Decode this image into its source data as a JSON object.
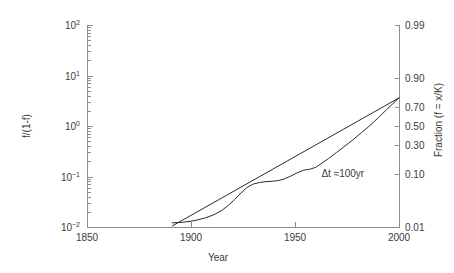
{
  "chart_data": {
    "type": "line",
    "title": "",
    "xlabel": "Year",
    "ylabel_left": "f/(1-f)",
    "ylabel_right": "Fraction (f = x/K)",
    "xlim": [
      1850,
      2000
    ],
    "ylim_odds": [
      0.01,
      100
    ],
    "yscale": "log-odds (logit)",
    "grid": false,
    "legend": "none",
    "xticks": [
      1850,
      1900,
      1950,
      2000
    ],
    "xticklabels": [
      "1850",
      "1900",
      "1950",
      "2000"
    ],
    "yticks_left_odds": [
      0.01,
      0.1,
      1,
      10,
      100
    ],
    "yticklabels_left": [
      "10-2",
      "10-1",
      "100",
      "101",
      "102"
    ],
    "yticks_right_fraction": [
      0.01,
      0.1,
      0.3,
      0.5,
      0.7,
      0.9,
      0.99
    ],
    "yticklabels_right": [
      "0.01",
      "0.10",
      "0.30",
      "0.50",
      "0.70",
      "0.90",
      "0.99"
    ],
    "annotations": [
      {
        "text": "Δt ≈100yr",
        "x": 1973,
        "y_fraction": 0.105
      }
    ],
    "series": [
      {
        "name": "logistic-fit-line",
        "style": "straight",
        "x": [
          1891,
          2000
        ],
        "y_odds": [
          0.0105,
          3.6
        ]
      },
      {
        "name": "observed-fraction",
        "style": "wiggly",
        "x": [
          1891,
          1896,
          1900,
          1903,
          1907,
          1911,
          1915,
          1918,
          1921,
          1924,
          1927,
          1930,
          1933,
          1936,
          1939,
          1942,
          1945,
          1948,
          1951,
          1954,
          1957,
          1960,
          1963,
          1966,
          1970,
          1974,
          1978,
          1982,
          1986,
          1990,
          1994,
          1997,
          2000
        ],
        "y_odds": [
          0.0121,
          0.0124,
          0.013,
          0.0138,
          0.0152,
          0.0175,
          0.0215,
          0.027,
          0.035,
          0.047,
          0.061,
          0.071,
          0.076,
          0.079,
          0.0805,
          0.083,
          0.09,
          0.102,
          0.118,
          0.133,
          0.139,
          0.152,
          0.185,
          0.225,
          0.3,
          0.4,
          0.54,
          0.74,
          1.02,
          1.45,
          2.1,
          2.75,
          3.6
        ]
      }
    ]
  },
  "axes": {
    "x_title": "Year",
    "y_left_title": "f/(1-f)",
    "y_right_title": "Fraction (f = x/K)"
  }
}
